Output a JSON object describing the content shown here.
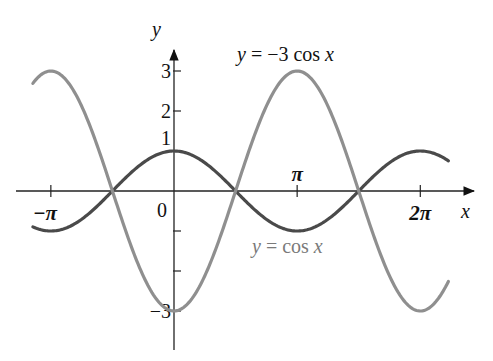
{
  "chart_data": {
    "type": "line",
    "title": "",
    "xlabel": "x",
    "ylabel": "y",
    "xlim": [
      -4.15,
      7.3
    ],
    "ylim": [
      -3.6,
      3.9
    ],
    "grid": false,
    "x_ticks": [
      {
        "value": -3.14159,
        "label": "−π"
      },
      {
        "value": 3.14159,
        "label": "π"
      },
      {
        "value": 6.28319,
        "label": "2π"
      }
    ],
    "y_ticks": [
      {
        "value": 3,
        "label": "3"
      },
      {
        "value": 2,
        "label": "2"
      },
      {
        "value": 1,
        "label": "1"
      },
      {
        "value": -1,
        "label": ""
      },
      {
        "value": -2,
        "label": ""
      },
      {
        "value": -3,
        "label": "−3"
      }
    ],
    "origin_label": "0",
    "series": [
      {
        "name": "y = cos x",
        "function": "cos(x)",
        "color": "#4a4a4a",
        "x_range": [
          -3.6,
          7.0
        ],
        "key_points": [
          {
            "x": -3.14159,
            "y": -1
          },
          {
            "x": -1.5708,
            "y": 0
          },
          {
            "x": 0,
            "y": 1
          },
          {
            "x": 1.5708,
            "y": 0
          },
          {
            "x": 3.14159,
            "y": -1
          },
          {
            "x": 4.7124,
            "y": 0
          },
          {
            "x": 6.28319,
            "y": 1
          }
        ]
      },
      {
        "name": "y = −3 cos x",
        "function": "-3*cos(x)",
        "color": "#8f8f8f",
        "x_range": [
          -3.6,
          7.0
        ],
        "key_points": [
          {
            "x": -3.14159,
            "y": 3
          },
          {
            "x": -1.5708,
            "y": 0
          },
          {
            "x": 0,
            "y": -3
          },
          {
            "x": 1.5708,
            "y": 0
          },
          {
            "x": 3.14159,
            "y": 3
          },
          {
            "x": 4.7124,
            "y": 0
          },
          {
            "x": 6.28319,
            "y": -3
          }
        ]
      }
    ],
    "annotations": [
      {
        "text_prefix": "y",
        "text_rest": " = −3 cos ",
        "text_var": "x",
        "series": "y = −3 cos x"
      },
      {
        "text_prefix": "y",
        "text_rest": " = cos ",
        "text_var": "x",
        "series": "y = cos x"
      }
    ]
  },
  "layout": {
    "origin_px": [
      174,
      191
    ],
    "px_per_unit_x": 39.2,
    "px_per_unit_y": 40,
    "x_axis_px": [
      16,
      476
    ],
    "y_axis_px": [
      48,
      350
    ]
  }
}
